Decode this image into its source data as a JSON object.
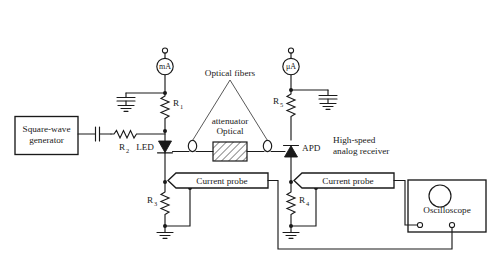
{
  "figure": {
    "type": "schematic-circuit-diagram",
    "domain": "optical-fiber-link-test-setup",
    "background_color": "#ffffff",
    "line_color": "#1a1a1a"
  },
  "labels": {
    "variable_voltage_source": "Variable\nvoltage source",
    "variable_voltage_source_line1": "Variable",
    "variable_voltage_source_line2": "voltage source",
    "variable_power_supply_line1": "Variable",
    "variable_power_supply_line2": "power supply",
    "milliamp_meter": "mA",
    "microamp_meter": "μA",
    "optical_fibers": "Optical fibers",
    "optical_attenuator_line1": "Optical",
    "optical_attenuator_line2": "attenuator",
    "square_wave_generator_line1": "Square-wave",
    "square_wave_generator_line2": "generator",
    "led": "LED",
    "apd": "APD",
    "high_speed_receiver_line1": "High-speed",
    "high_speed_receiver_line2": "analog receiver",
    "current_probe_left": "Current probe",
    "current_probe_right": "Current probe",
    "oscilloscope": "Oscilloscope",
    "r1": "R",
    "r1_sub": "1",
    "r2": "R",
    "r2_sub": "2",
    "r3": "R",
    "r3_sub": "3",
    "r4": "R",
    "r4_sub": "4",
    "r5": "R",
    "r5_sub": "5"
  },
  "components": [
    {
      "name": "variable-voltage-source-terminal",
      "kind": "open-terminal"
    },
    {
      "name": "milliampere-meter",
      "kind": "meter",
      "reading_label": "mA"
    },
    {
      "name": "bypass-capacitor-left",
      "kind": "capacitor"
    },
    {
      "name": "ground-left-capacitor",
      "kind": "ground"
    },
    {
      "name": "resistor-r1",
      "kind": "resistor",
      "label": "R1"
    },
    {
      "name": "square-wave-generator",
      "kind": "source-box"
    },
    {
      "name": "coupling-capacitor",
      "kind": "capacitor"
    },
    {
      "name": "resistor-r2",
      "kind": "resistor",
      "label": "R2"
    },
    {
      "name": "led-diode",
      "kind": "diode",
      "label": "LED"
    },
    {
      "name": "resistor-r3",
      "kind": "resistor",
      "label": "R3"
    },
    {
      "name": "ground-r3",
      "kind": "ground"
    },
    {
      "name": "fiber-coupler-left",
      "kind": "fiber-connector"
    },
    {
      "name": "optical-attenuator",
      "kind": "hatched-box"
    },
    {
      "name": "fiber-coupler-right",
      "kind": "fiber-connector"
    },
    {
      "name": "variable-power-supply-terminal",
      "kind": "open-terminal"
    },
    {
      "name": "microampere-meter",
      "kind": "meter",
      "reading_label": "μA"
    },
    {
      "name": "bypass-capacitor-right",
      "kind": "capacitor"
    },
    {
      "name": "ground-right-capacitor",
      "kind": "ground"
    },
    {
      "name": "resistor-r5",
      "kind": "resistor",
      "label": "R5"
    },
    {
      "name": "apd-diode",
      "kind": "diode",
      "label": "APD"
    },
    {
      "name": "resistor-r4",
      "kind": "resistor",
      "label": "R4"
    },
    {
      "name": "ground-r4",
      "kind": "ground"
    },
    {
      "name": "current-probe-left",
      "kind": "probe-flag"
    },
    {
      "name": "current-probe-right",
      "kind": "probe-flag"
    },
    {
      "name": "oscilloscope",
      "kind": "instrument-box"
    }
  ]
}
